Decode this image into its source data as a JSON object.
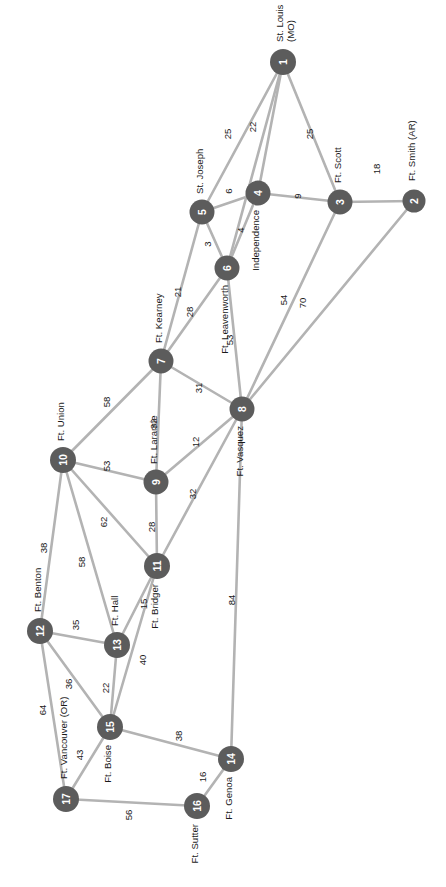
{
  "figure": {
    "kind": "node-link-network-diagram",
    "width": 446,
    "height": 887,
    "background_color": "#ffffff",
    "node_color": "#5c5c5c",
    "node_label_color": "#ffffff",
    "edge_color": "#b3b3b3",
    "text_color": "#1a1a1a",
    "orientation_note": "all text rotated 90 degrees (reading bottom-to-top)"
  },
  "chart_data": {
    "type": "network",
    "title": "",
    "xlabel": "",
    "ylabel": "",
    "grid": false,
    "legend": "none",
    "node_count": 17,
    "edge_count": 32,
    "nodes": [
      {
        "id": "1",
        "label": "1",
        "name": "St. Louis (MO)",
        "x": 283,
        "y": 62,
        "r": 13,
        "name_dx": -20,
        "name_dy": -3,
        "name_anchor": "end",
        "name_lines": [
          "St. Louis",
          "(MO)"
        ]
      },
      {
        "id": "2",
        "label": "2",
        "name": "Ft. Smith (AR)",
        "x": 414,
        "y": 201,
        "r": 11.5,
        "name_dx": -20,
        "name_dy": -2,
        "name_anchor": "end",
        "name_lines": [
          "Ft. Smith (AR)"
        ]
      },
      {
        "id": "3",
        "label": "3",
        "name": "Ft. Scott",
        "x": 340,
        "y": 202,
        "r": 12.5,
        "name_dx": -19,
        "name_dy": -2,
        "name_anchor": "end",
        "name_lines": [
          "Ft. Scott"
        ]
      },
      {
        "id": "4",
        "label": "4",
        "name": "Independence",
        "x": 258,
        "y": 193,
        "r": 12.5,
        "name_dx": 17,
        "name_dy": -2,
        "name_anchor": "start",
        "name_lines": [
          "Independence"
        ]
      },
      {
        "id": "5",
        "label": "5",
        "name": "St. Joseph",
        "x": 202,
        "y": 212,
        "r": 12.5,
        "name_dx": -18,
        "name_dy": -2,
        "name_anchor": "end",
        "name_lines": [
          "St. Joseph"
        ]
      },
      {
        "id": "6",
        "label": "6",
        "name": "Ft. Leavenworth",
        "x": 227,
        "y": 268,
        "r": 12.5,
        "name_dx": 17,
        "name_dy": -2,
        "name_anchor": "start",
        "name_lines": [
          "Ft. Leavenworth"
        ]
      },
      {
        "id": "7",
        "label": "7",
        "name": "Ft. Kearney",
        "x": 161,
        "y": 361,
        "r": 12.5,
        "name_dx": -18,
        "name_dy": -2,
        "name_anchor": "end",
        "name_lines": [
          "Ft. Kearney"
        ]
      },
      {
        "id": "8",
        "label": "8",
        "name": "Ft. Vasquez",
        "x": 242,
        "y": 409,
        "r": 12.5,
        "name_dx": 17,
        "name_dy": -2,
        "name_anchor": "start",
        "name_lines": [
          "Ft. Vasquez"
        ]
      },
      {
        "id": "9",
        "label": "9",
        "name": "Ft. Laramie",
        "x": 156,
        "y": 482,
        "r": 12.5,
        "name_dx": -18,
        "name_dy": -2,
        "name_anchor": "end",
        "name_lines": [
          "Ft. Laramie"
        ]
      },
      {
        "id": "10",
        "label": "10",
        "name": "Ft. Union",
        "x": 63,
        "y": 460,
        "r": 13,
        "name_dx": -19,
        "name_dy": -2,
        "name_anchor": "end",
        "name_lines": [
          "Ft. Union"
        ]
      },
      {
        "id": "11",
        "label": "11",
        "name": "Ft. Bridger",
        "x": 157,
        "y": 566,
        "r": 13,
        "name_dx": 18,
        "name_dy": -2,
        "name_anchor": "start",
        "name_lines": [
          "Ft. Bridger"
        ]
      },
      {
        "id": "12",
        "label": "12",
        "name": "Ft. Benton",
        "x": 40,
        "y": 631,
        "r": 13,
        "name_dx": -19,
        "name_dy": -2,
        "name_anchor": "end",
        "name_lines": [
          "Ft. Benton"
        ]
      },
      {
        "id": "13",
        "label": "13",
        "name": "Ft. Hall",
        "x": 117,
        "y": 645,
        "r": 13,
        "name_dx": -19,
        "name_dy": -2,
        "name_anchor": "end",
        "name_lines": [
          "Ft. Hall"
        ]
      },
      {
        "id": "14",
        "label": "14",
        "name": "Ft. Genoa",
        "x": 231,
        "y": 759,
        "r": 13,
        "name_dx": 18,
        "name_dy": -2,
        "name_anchor": "start",
        "name_lines": [
          "Ft. Genoa"
        ]
      },
      {
        "id": "15",
        "label": "15",
        "name": "Ft. Boise",
        "x": 110,
        "y": 727,
        "r": 13,
        "name_dx": 18,
        "name_dy": -2,
        "name_anchor": "start",
        "name_lines": [
          "Ft. Boise"
        ]
      },
      {
        "id": "16",
        "label": "16",
        "name": "Ft. Sutter",
        "x": 197,
        "y": 806,
        "r": 13,
        "name_dx": 18,
        "name_dy": -2,
        "name_anchor": "start",
        "name_lines": [
          "Ft. Sutter"
        ]
      },
      {
        "id": "17",
        "label": "17",
        "name": "Ft. Vancouver (OR)",
        "x": 66,
        "y": 799,
        "r": 13,
        "name_dx": -20,
        "name_dy": -2,
        "name_anchor": "end",
        "name_lines": [
          "Ft. Vancouver (OR)"
        ]
      }
    ],
    "edges": [
      {
        "source": "1",
        "target": "5",
        "weight": 25,
        "lx": 228,
        "ly": 134
      },
      {
        "source": "1",
        "target": "6",
        "weight": 22,
        "ly": 127,
        "lx": 253
      },
      {
        "source": "1",
        "target": "4",
        "weight": null,
        "lx": null,
        "ly": null,
        "hidden_label": true
      },
      {
        "source": "1",
        "target": "3",
        "weight": 25,
        "lx": 310,
        "ly": 134
      },
      {
        "source": "2",
        "target": "3",
        "weight": 18,
        "lx": 377,
        "ly": 169
      },
      {
        "source": "2",
        "target": "8",
        "weight": 70,
        "lx": 303,
        "ly": 303
      },
      {
        "source": "3",
        "target": "4",
        "weight": 9,
        "lx": 298,
        "ly": 196
      },
      {
        "source": "3",
        "target": "8",
        "weight": 54,
        "lx": 284,
        "ly": 300
      },
      {
        "source": "4",
        "target": "5",
        "weight": 6,
        "lx": 229,
        "ly": 191
      },
      {
        "source": "4",
        "target": "6",
        "weight": 4,
        "lx": 241,
        "ly": 230
      },
      {
        "source": "5",
        "target": "6",
        "weight": 3,
        "lx": 208,
        "ly": 244
      },
      {
        "source": "5",
        "target": "7",
        "weight": 21,
        "lx": 178,
        "ly": 292
      },
      {
        "source": "6",
        "target": "7",
        "weight": 28,
        "lx": 190,
        "ly": 312
      },
      {
        "source": "6",
        "target": "8",
        "weight": 53,
        "lx": 230,
        "ly": 340
      },
      {
        "source": "7",
        "target": "8",
        "weight": 31,
        "lx": 199,
        "ly": 388
      },
      {
        "source": "7",
        "target": "9",
        "weight": 32,
        "lx": 154,
        "ly": 424
      },
      {
        "source": "7",
        "target": "10",
        "weight": 58,
        "lx": 107,
        "ly": 402
      },
      {
        "source": "8",
        "target": "9",
        "weight": 12,
        "lx": 196,
        "ly": 442
      },
      {
        "source": "8",
        "target": "11",
        "weight": 32,
        "lx": 193,
        "ly": 494
      },
      {
        "source": "8",
        "target": "14",
        "weight": 84,
        "lx": 232,
        "ly": 600
      },
      {
        "source": "9",
        "target": "10",
        "weight": 53,
        "lx": 107,
        "ly": 466
      },
      {
        "source": "9",
        "target": "11",
        "weight": 28,
        "lx": 152,
        "ly": 527
      },
      {
        "source": "10",
        "target": "11",
        "weight": 62,
        "lx": 104,
        "ly": 522
      },
      {
        "source": "10",
        "target": "12",
        "weight": 38,
        "lx": 44,
        "ly": 548
      },
      {
        "source": "10",
        "target": "13",
        "weight": 58,
        "lx": 82,
        "ly": 562
      },
      {
        "source": "11",
        "target": "13",
        "weight": 15,
        "lx": 144,
        "ly": 604
      },
      {
        "source": "11",
        "target": "15",
        "weight": 40,
        "lx": 143,
        "ly": 660
      },
      {
        "source": "12",
        "target": "13",
        "weight": 35,
        "lx": 76,
        "ly": 625
      },
      {
        "source": "12",
        "target": "15",
        "weight": 36,
        "lx": 69,
        "ly": 684
      },
      {
        "source": "12",
        "target": "17",
        "weight": 64,
        "lx": 43,
        "ly": 710
      },
      {
        "source": "13",
        "target": "15",
        "weight": 22,
        "lx": 106,
        "ly": 688
      },
      {
        "source": "14",
        "target": "15",
        "weight": 38,
        "lx": 179,
        "ly": 736
      },
      {
        "source": "14",
        "target": "16",
        "weight": 16,
        "lx": 203,
        "ly": 777
      },
      {
        "source": "15",
        "target": "17",
        "weight": 43,
        "lx": 80,
        "ly": 755
      },
      {
        "source": "16",
        "target": "17",
        "weight": 56,
        "lx": 129,
        "ly": 815
      }
    ],
    "weights_list": [
      25,
      22,
      25,
      18,
      70,
      9,
      54,
      6,
      4,
      3,
      21,
      28,
      53,
      31,
      32,
      58,
      12,
      32,
      84,
      53,
      28,
      62,
      38,
      58,
      15,
      40,
      35,
      36,
      64,
      22,
      38,
      16,
      43,
      56
    ]
  }
}
